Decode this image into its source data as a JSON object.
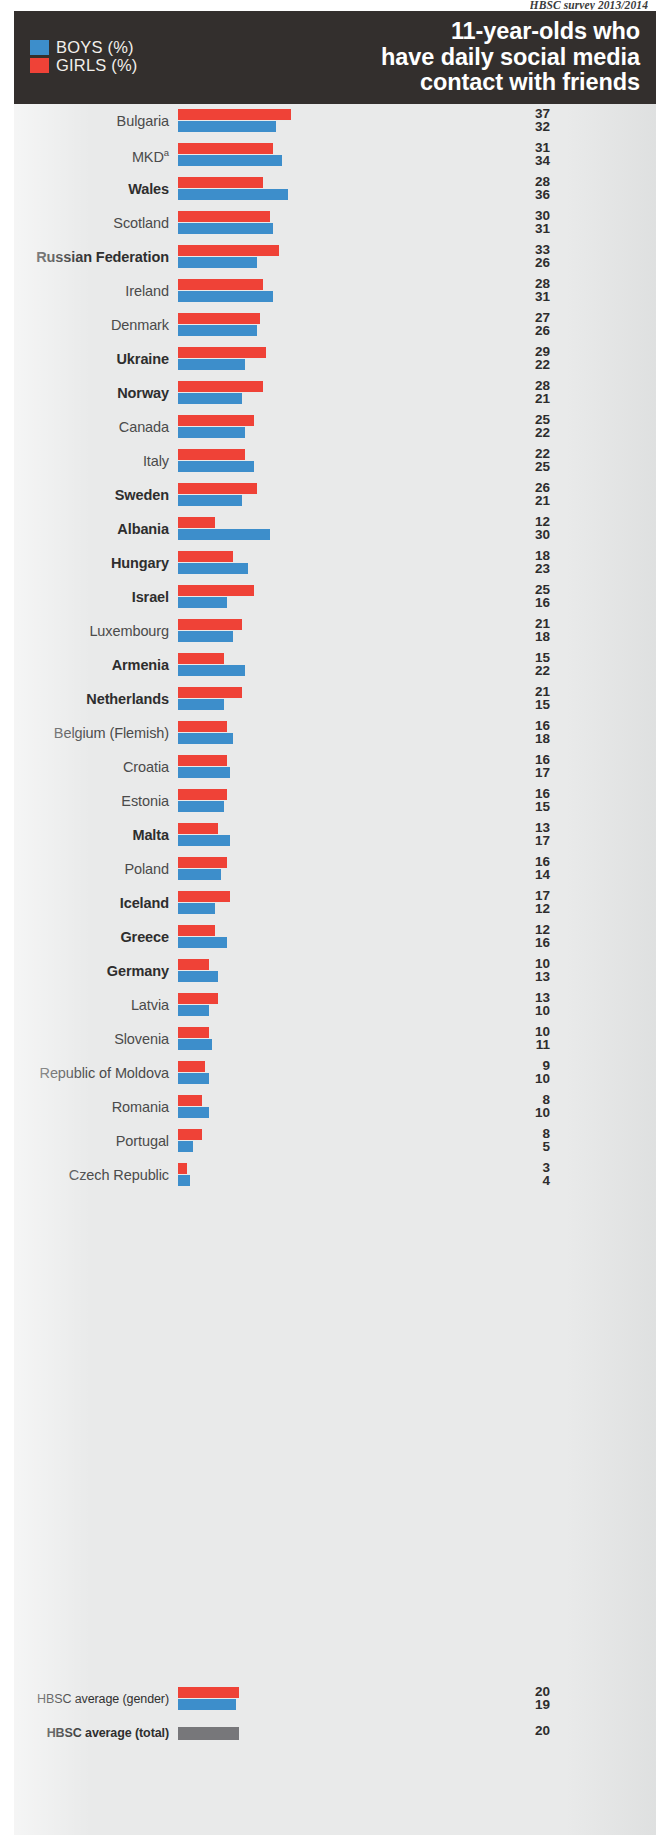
{
  "source_note": "HBSC survey 2013/2014",
  "header": {
    "title_line1": "11-year-olds who",
    "title_line2": "have daily social media",
    "title_line3": "contact with friends",
    "legend": [
      {
        "key": "boys",
        "label": "BOYS (%)",
        "color": "#3d8ecb"
      },
      {
        "key": "girls",
        "label": "GIRLS (%)",
        "color": "#ef4237"
      }
    ]
  },
  "averages": {
    "gender_label": "HBSC average (gender)",
    "gender_girls": 20,
    "gender_boys": 19,
    "total_label": "HBSC average (total)",
    "total_value": 20,
    "total_color": "#77777a"
  },
  "chart_data": {
    "type": "bar",
    "title": "11-year-olds who have daily social media contact with friends",
    "subtitle": "HBSC survey 2013/2014",
    "orientation": "horizontal",
    "grouped": true,
    "xlabel": "%",
    "ylabel": "",
    "xlim": [
      0,
      40
    ],
    "grid": false,
    "legend_position": "top-left",
    "note": "Values listed per country: first (upper) number is GIRLS (%), second (lower) number is BOYS (%). Bold country labels are highlighted in the original figure.",
    "footnote_marker": "a",
    "series": [
      {
        "name": "GIRLS (%)",
        "color": "#ef4237",
        "values": [
          37,
          31,
          28,
          30,
          33,
          28,
          27,
          29,
          28,
          25,
          22,
          26,
          12,
          18,
          25,
          21,
          15,
          21,
          16,
          16,
          16,
          13,
          16,
          17,
          12,
          10,
          13,
          10,
          9,
          8,
          8,
          3
        ]
      },
      {
        "name": "BOYS (%)",
        "color": "#3d8ecb",
        "values": [
          32,
          34,
          36,
          31,
          26,
          31,
          26,
          22,
          21,
          22,
          25,
          21,
          30,
          23,
          16,
          18,
          22,
          15,
          18,
          17,
          15,
          17,
          14,
          12,
          16,
          13,
          10,
          11,
          10,
          10,
          5,
          4
        ]
      }
    ],
    "categories": [
      "Bulgaria",
      "MKD",
      "Wales",
      "Scotland",
      "Russian Federation",
      "Ireland",
      "Denmark",
      "Ukraine",
      "Norway",
      "Canada",
      "Italy",
      "Sweden",
      "Albania",
      "Hungary",
      "Israel",
      "Luxembourg",
      "Armenia",
      "Netherlands",
      "Belgium (Flemish)",
      "Croatia",
      "Estonia",
      "Malta",
      "Poland",
      "Iceland",
      "Greece",
      "Germany",
      "Latvia",
      "Slovenia",
      "Republic of Moldova",
      "Romania",
      "Portugal",
      "Czech Republic"
    ],
    "averages": {
      "girls": 20,
      "boys": 19,
      "total": 20
    }
  },
  "rows": [
    {
      "label": "Bulgaria",
      "sup": "",
      "bold": false,
      "girls": 37,
      "boys": 32
    },
    {
      "label": "MKD",
      "sup": "a",
      "bold": false,
      "girls": 31,
      "boys": 34
    },
    {
      "label": "Wales",
      "sup": "",
      "bold": true,
      "girls": 28,
      "boys": 36
    },
    {
      "label": "Scotland",
      "sup": "",
      "bold": false,
      "girls": 30,
      "boys": 31
    },
    {
      "label": "Russian Federation",
      "sup": "",
      "bold": true,
      "girls": 33,
      "boys": 26
    },
    {
      "label": "Ireland",
      "sup": "",
      "bold": false,
      "girls": 28,
      "boys": 31
    },
    {
      "label": "Denmark",
      "sup": "",
      "bold": false,
      "girls": 27,
      "boys": 26
    },
    {
      "label": "Ukraine",
      "sup": "",
      "bold": true,
      "girls": 29,
      "boys": 22
    },
    {
      "label": "Norway",
      "sup": "",
      "bold": true,
      "girls": 28,
      "boys": 21
    },
    {
      "label": "Canada",
      "sup": "",
      "bold": false,
      "girls": 25,
      "boys": 22
    },
    {
      "label": "Italy",
      "sup": "",
      "bold": false,
      "girls": 22,
      "boys": 25
    },
    {
      "label": "Sweden",
      "sup": "",
      "bold": true,
      "girls": 26,
      "boys": 21
    },
    {
      "label": "Albania",
      "sup": "",
      "bold": true,
      "girls": 12,
      "boys": 30
    },
    {
      "label": "Hungary",
      "sup": "",
      "bold": true,
      "girls": 18,
      "boys": 23
    },
    {
      "label": "Israel",
      "sup": "",
      "bold": true,
      "girls": 25,
      "boys": 16
    },
    {
      "label": "Luxembourg",
      "sup": "",
      "bold": false,
      "girls": 21,
      "boys": 18
    },
    {
      "label": "Armenia",
      "sup": "",
      "bold": true,
      "girls": 15,
      "boys": 22
    },
    {
      "label": "Netherlands",
      "sup": "",
      "bold": true,
      "girls": 21,
      "boys": 15
    },
    {
      "label": "Belgium (Flemish)",
      "sup": "",
      "bold": false,
      "girls": 16,
      "boys": 18
    },
    {
      "label": "Croatia",
      "sup": "",
      "bold": false,
      "girls": 16,
      "boys": 17
    },
    {
      "label": "Estonia",
      "sup": "",
      "bold": false,
      "girls": 16,
      "boys": 15
    },
    {
      "label": "Malta",
      "sup": "",
      "bold": true,
      "girls": 13,
      "boys": 17
    },
    {
      "label": "Poland",
      "sup": "",
      "bold": false,
      "girls": 16,
      "boys": 14
    },
    {
      "label": "Iceland",
      "sup": "",
      "bold": true,
      "girls": 17,
      "boys": 12
    },
    {
      "label": "Greece",
      "sup": "",
      "bold": true,
      "girls": 12,
      "boys": 16
    },
    {
      "label": "Germany",
      "sup": "",
      "bold": true,
      "girls": 10,
      "boys": 13
    },
    {
      "label": "Latvia",
      "sup": "",
      "bold": false,
      "girls": 13,
      "boys": 10
    },
    {
      "label": "Slovenia",
      "sup": "",
      "bold": false,
      "girls": 10,
      "boys": 11
    },
    {
      "label": "Republic of Moldova",
      "sup": "",
      "bold": false,
      "girls": 9,
      "boys": 10
    },
    {
      "label": "Romania",
      "sup": "",
      "bold": false,
      "girls": 8,
      "boys": 10
    },
    {
      "label": "Portugal",
      "sup": "",
      "bold": false,
      "girls": 8,
      "boys": 5
    },
    {
      "label": "Czech Republic",
      "sup": "",
      "bold": false,
      "girls": 3,
      "boys": 4
    }
  ]
}
